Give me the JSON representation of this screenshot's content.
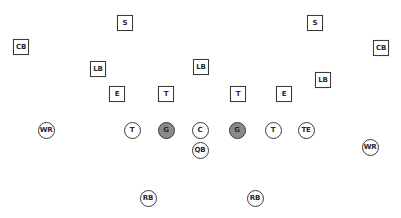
{
  "diagram": {
    "type": "football-formation",
    "colors": {
      "background": "#ffffff",
      "outline": "#3a3a3a",
      "text": "#2a2a2a",
      "guard_fill": "#8a8a8a"
    }
  },
  "defense": [
    {
      "id": "s_left",
      "label": "S",
      "x": 125,
      "y": 23
    },
    {
      "id": "s_right",
      "label": "S",
      "x": 315,
      "y": 23
    },
    {
      "id": "cb_left",
      "label": "CB",
      "x": 21,
      "y": 47
    },
    {
      "id": "cb_right",
      "label": "CB",
      "x": 381,
      "y": 48
    },
    {
      "id": "lb_left",
      "label": "LB",
      "x": 98,
      "y": 69
    },
    {
      "id": "lb_middle",
      "label": "LB",
      "x": 201,
      "y": 67
    },
    {
      "id": "lb_right",
      "label": "LB",
      "x": 323,
      "y": 80
    },
    {
      "id": "e_left",
      "label": "E",
      "x": 117,
      "y": 94
    },
    {
      "id": "t_left",
      "label": "T",
      "x": 166,
      "y": 94
    },
    {
      "id": "t_right",
      "label": "T",
      "x": 238,
      "y": 94
    },
    {
      "id": "e_right",
      "label": "E",
      "x": 284,
      "y": 94
    }
  ],
  "offense": [
    {
      "id": "wr_left",
      "label": "WR",
      "x": 46,
      "y": 130,
      "filled": false
    },
    {
      "id": "t_left",
      "label": "T",
      "x": 132,
      "y": 130,
      "filled": false
    },
    {
      "id": "g_left",
      "label": "G",
      "x": 166,
      "y": 130,
      "filled": true
    },
    {
      "id": "c",
      "label": "C",
      "x": 200,
      "y": 130,
      "filled": false
    },
    {
      "id": "g_right",
      "label": "G",
      "x": 237,
      "y": 130,
      "filled": true
    },
    {
      "id": "t_right",
      "label": "T",
      "x": 273,
      "y": 130,
      "filled": false
    },
    {
      "id": "te",
      "label": "TE",
      "x": 306,
      "y": 130,
      "filled": false
    },
    {
      "id": "qb",
      "label": "QB",
      "x": 200,
      "y": 150,
      "filled": false
    },
    {
      "id": "wr_right",
      "label": "WR",
      "x": 370,
      "y": 147,
      "filled": false
    },
    {
      "id": "rb_left",
      "label": "RB",
      "x": 148,
      "y": 198,
      "filled": false
    },
    {
      "id": "rb_right",
      "label": "RB",
      "x": 255,
      "y": 198,
      "filled": false
    }
  ]
}
